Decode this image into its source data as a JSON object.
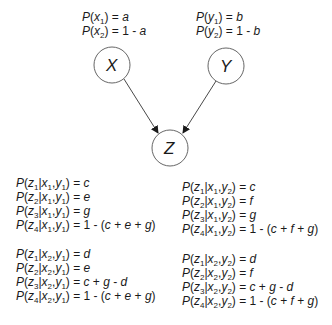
{
  "diagram": {
    "type": "bayesian-network",
    "nodes": [
      {
        "id": "X",
        "label": "X",
        "cx": 112,
        "cy": 65,
        "r": 18
      },
      {
        "id": "Y",
        "label": "Y",
        "cx": 226,
        "cy": 66,
        "r": 18
      },
      {
        "id": "Z",
        "label": "Z",
        "cx": 170,
        "cy": 148,
        "r": 18
      }
    ],
    "edges": [
      {
        "from": "X",
        "to": "Z"
      },
      {
        "from": "Y",
        "to": "Z"
      }
    ],
    "priors": {
      "x": [
        "P(x1) = a",
        "P(x2) = 1 - a"
      ],
      "y": [
        "P(y1) = b",
        "P(y2) = 1 - b"
      ]
    },
    "cpt": {
      "x1y1": [
        "P(z1|x1,y1) = c",
        "P(z2|x1,y1) = e",
        "P(z3|x1,y1) = g",
        "P(z4|x1,y1) = 1 - (c + e + g)"
      ],
      "x2y1": [
        "P(z1|x2,y1) = d",
        "P(z2|x2,y1) = e",
        "P(z3|x2,y1) = c + g - d",
        "P(z4|x2,y1) = 1 - (c + e + g)"
      ],
      "x1y2": [
        "P(z1|x1,y2) = c",
        "P(z2|x1,y2) = f",
        "P(z3|x1,y2) = g",
        "P(z4|x1,y2) = 1 - (c + f + g)"
      ],
      "x2y2": [
        "P(z1|x2,y2) = d",
        "P(z2|x2,y2) = f",
        "P(z3|x2,y2) = c + g - d",
        "P(z4|x2,y2) = 1 - (c + f + g)"
      ]
    }
  }
}
